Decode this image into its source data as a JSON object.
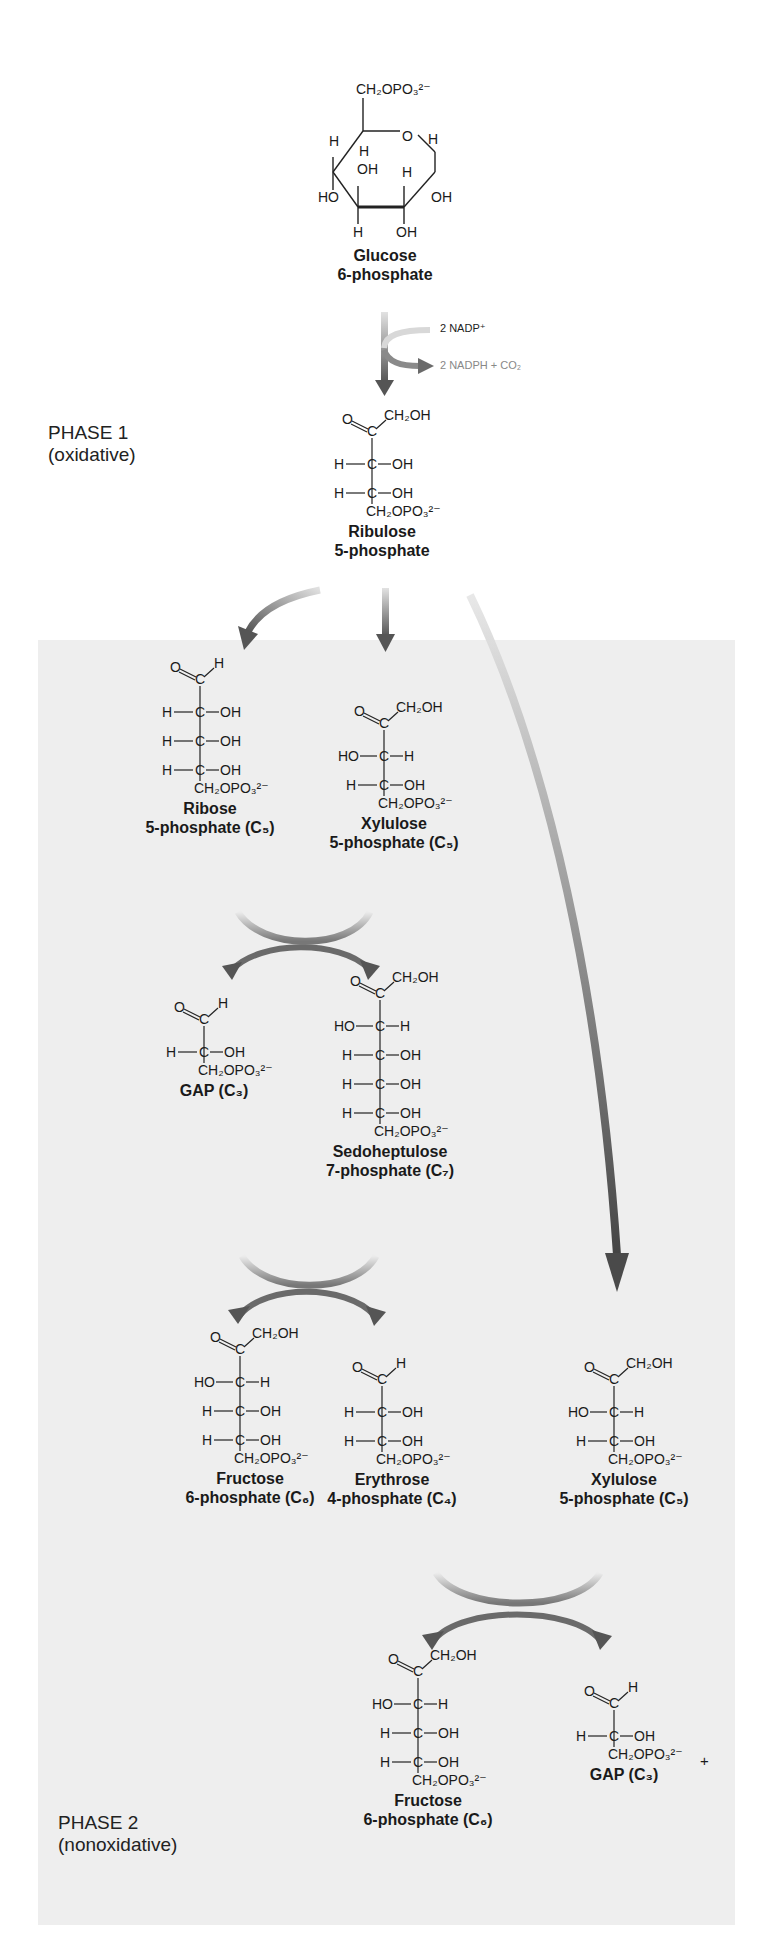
{
  "figure": {
    "phase1": {
      "label": "PHASE 1",
      "sublabel": "(oxidative)"
    },
    "phase2": {
      "label": "PHASE 2",
      "sublabel": "(nonoxidative)"
    },
    "reagents": {
      "in": "2 NADP⁺",
      "out": "2 NADPH + CO₂"
    },
    "plus": "+",
    "colors": {
      "panel": "#eeeeee",
      "arrow_dark": "#5a5a5a",
      "arrow_light": "#d8d8d8",
      "text": "#1a1a1a"
    },
    "molecules": {
      "glucose6p": {
        "name1": "Glucose",
        "name2": "6-phosphate",
        "top_group": "CH₂OPO₃²⁻"
      },
      "ribulose5p": {
        "name1": "Ribulose",
        "name2": "5-phosphate",
        "rows": [
          "H—C—OH",
          "H—C—OH"
        ]
      },
      "ribose5p": {
        "name1": "Ribose",
        "name2": "5-phosphate (C₅)"
      },
      "xylulose5p_a": {
        "name1": "Xylulose",
        "name2": "5-phosphate (C₅)"
      },
      "gap_a": {
        "name1": "GAP (C₃)"
      },
      "sedoheptulose7p": {
        "name1": "Sedoheptulose",
        "name2": "7-phosphate (C₇)"
      },
      "fructose6p_a": {
        "name1": "Fructose",
        "name2": "6-phosphate (C₆)"
      },
      "erythrose4p": {
        "name1": "Erythrose",
        "name2": "4-phosphate (C₄)"
      },
      "xylulose5p_b": {
        "name1": "Xylulose",
        "name2": "5-phosphate (C₅)"
      },
      "fructose6p_b": {
        "name1": "Fructose",
        "name2": "6-phosphate (C₆)"
      },
      "gap_b": {
        "name1": "GAP (C₃)"
      }
    },
    "groups": {
      "o": "O",
      "h": "H",
      "c": "C",
      "oh": "OH",
      "ho": "HO",
      "ch2oh": "CH₂OH",
      "ch2opo3": "CH₂OPO₃²⁻",
      "h_c_oh": "H—C—OH",
      "ho_c_h": "HO—C—H"
    }
  }
}
